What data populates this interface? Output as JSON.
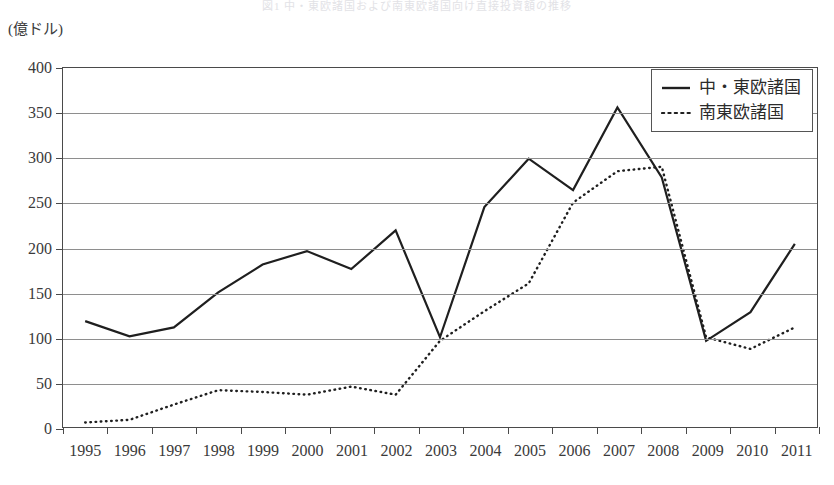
{
  "caption_strip": "図1 中・東欧諸国および南東欧諸国向け直接投資額の推移",
  "unit_label": "(億ドル)",
  "legend": {
    "items": [
      {
        "label": "中・東欧諸国",
        "style": "solid",
        "icon": "solid-line-icon"
      },
      {
        "label": "南東欧諸国",
        "style": "dotted",
        "icon": "dotted-line-icon"
      }
    ]
  },
  "chart_data": {
    "type": "line",
    "title": "",
    "xlabel": "",
    "ylabel": "(億ドル)",
    "ylim": [
      0,
      400
    ],
    "ytick_step": 50,
    "yticks": [
      0,
      50,
      100,
      150,
      200,
      250,
      300,
      350,
      400
    ],
    "ytick_labels": [
      "0",
      "50",
      "100",
      "150",
      "200",
      "250",
      "300",
      "350",
      "400"
    ],
    "grid": true,
    "legend_position": "top-right",
    "categories": [
      "1995",
      "1996",
      "1997",
      "1998",
      "1999",
      "2000",
      "2001",
      "2002",
      "2003",
      "2004",
      "2005",
      "2006",
      "2007",
      "2008",
      "2009",
      "2010",
      "2011"
    ],
    "series": [
      {
        "name": "中・東欧諸国",
        "style": "solid",
        "values": [
          118,
          101,
          111,
          150,
          181,
          196,
          176,
          219,
          100,
          245,
          299,
          264,
          356,
          278,
          96,
          128,
          204
        ]
      },
      {
        "name": "南東欧諸国",
        "style": "dotted",
        "values": [
          5,
          8,
          25,
          41,
          39,
          36,
          45,
          36,
          96,
          129,
          160,
          250,
          285,
          290,
          100,
          87,
          111
        ]
      }
    ]
  }
}
